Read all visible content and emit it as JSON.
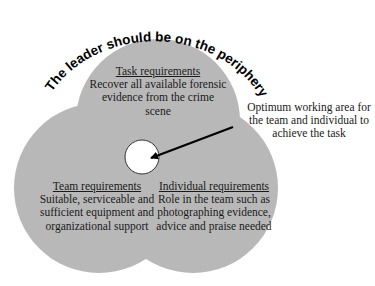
{
  "diagram": {
    "arc_caption": "The leader should be on the periphery looking in",
    "circles": [
      {
        "id": "task",
        "title": "Task requirements",
        "body": "Recover all available forensic evidence from the crime scene"
      },
      {
        "id": "team",
        "title": "Team requirements",
        "body": "Suitable, serviceable and sufficient equipment and organizational support"
      },
      {
        "id": "individual",
        "title": "Individual requirements",
        "body": "Role in the team such as photographing evidence, advice and praise needed"
      }
    ],
    "center_annotation": "Optimum working area for the team and individual to achieve the task",
    "colors": {
      "circle_fill": "#b8b8b8",
      "center_fill": "#ffffff",
      "ink": "#000000"
    }
  }
}
